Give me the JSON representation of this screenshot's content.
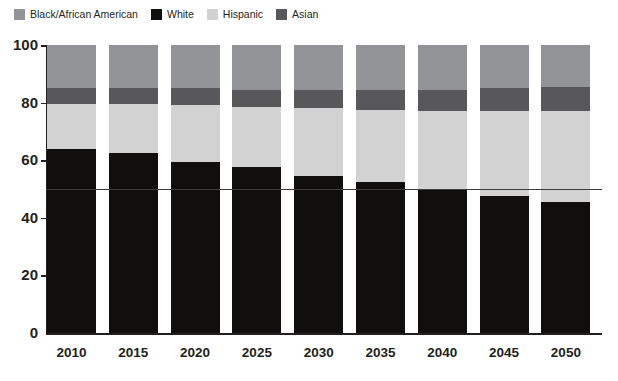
{
  "chart_data": {
    "type": "bar",
    "subtype": "stacked-100-percent",
    "title": "",
    "xlabel": "",
    "ylabel": "",
    "ylim": [
      0,
      100
    ],
    "yticks": [
      0,
      20,
      40,
      60,
      80,
      100
    ],
    "grid": false,
    "legend_position": "top-left",
    "categories": [
      "2010",
      "2015",
      "2020",
      "2025",
      "2030",
      "2035",
      "2040",
      "2045",
      "2050"
    ],
    "series": [
      {
        "name": "White",
        "color": "#100f0d",
        "values": [
          64.0,
          62.5,
          59.5,
          57.5,
          54.5,
          52.5,
          49.5,
          47.5,
          45.5
        ]
      },
      {
        "name": "Hispanic",
        "color": "#d2d2d2",
        "values": [
          15.5,
          17.0,
          19.5,
          21.0,
          23.5,
          25.0,
          27.5,
          29.5,
          31.5
        ]
      },
      {
        "name": "Asian",
        "color": "#58585b",
        "values": [
          5.5,
          5.5,
          6.0,
          6.0,
          6.5,
          7.0,
          7.5,
          8.0,
          8.5
        ]
      },
      {
        "name": "Black/African American",
        "color": "#929497",
        "values": [
          15.0,
          15.0,
          15.0,
          15.5,
          15.5,
          15.5,
          15.5,
          15.0,
          14.5
        ]
      }
    ],
    "stack_order_bottom_to_top": [
      "White",
      "Hispanic",
      "Asian",
      "Black/African American"
    ],
    "reference_line": {
      "value": 50,
      "color": "#3c3c3c"
    },
    "annotations": []
  },
  "legend": {
    "items": [
      {
        "label": "Black/African American",
        "color": "#929497"
      },
      {
        "label": "White",
        "color": "#100f0d"
      },
      {
        "label": "Hispanic",
        "color": "#d2d2d2"
      },
      {
        "label": "Asian",
        "color": "#58585b"
      }
    ]
  },
  "axes": {
    "y_tick_labels": [
      "100",
      "80",
      "60",
      "40",
      "20",
      "0"
    ],
    "x_tick_labels": [
      "2010",
      "2015",
      "2020",
      "2025",
      "2030",
      "2035",
      "2040",
      "2045",
      "2050"
    ]
  }
}
